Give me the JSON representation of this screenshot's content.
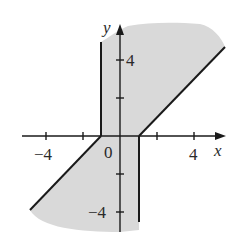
{
  "figure": {
    "axes": {
      "x_label": "x",
      "y_label": "y",
      "x_ticks": [
        -4,
        -2,
        2,
        4
      ],
      "y_ticks": [
        -4,
        -2,
        2,
        4
      ],
      "x_tick_labels": [
        "−4",
        "0",
        "4"
      ],
      "y_tick_labels": [
        "4",
        "−4"
      ],
      "origin_label": "0"
    },
    "region": {
      "description": "Shaded region bounded by x = -1 (upper half-plane part), x = 1 (lower half-plane part), and lines y = x - 1 (x ≥ 1) and y = x + 1 (x ≤ -1)",
      "fill_color": "#d9d9d9"
    },
    "boundaries": [
      {
        "type": "vertical",
        "x": -1,
        "y_range": [
          0,
          5
        ]
      },
      {
        "type": "vertical",
        "x": 1,
        "y_range": [
          -5,
          0
        ]
      },
      {
        "type": "line",
        "equation": "y = x - 1",
        "x_range": [
          1,
          5.9
        ]
      },
      {
        "type": "line",
        "equation": "y = x + 1",
        "x_range": [
          -4.9,
          -1
        ]
      }
    ],
    "line_color": "#1a1a1a"
  }
}
